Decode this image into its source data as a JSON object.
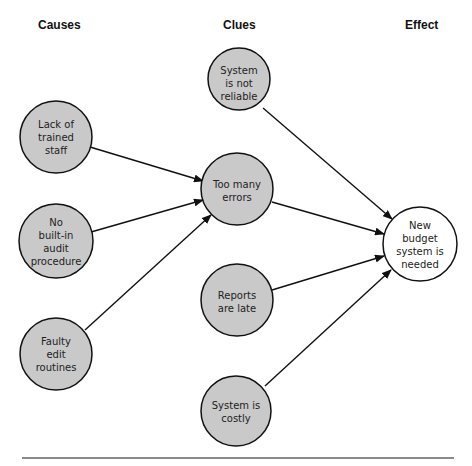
{
  "headers": {
    "causes": "Causes",
    "clues": "Clues",
    "effect": "Effect"
  },
  "colors": {
    "node_fill": "#c9c9c9",
    "effect_fill": "#ffffff",
    "stroke": "#111111"
  },
  "nodes": [
    {
      "id": "lack",
      "column": "causes",
      "lines": [
        "Lack of",
        "trained",
        "staff"
      ]
    },
    {
      "id": "audit",
      "column": "causes",
      "lines": [
        "No",
        "built-in",
        "audit",
        "procedure"
      ]
    },
    {
      "id": "faulty",
      "column": "causes",
      "lines": [
        "Faulty",
        "edit",
        "routines"
      ]
    },
    {
      "id": "reliable",
      "column": "clues",
      "lines": [
        "System",
        "is not",
        "reliable"
      ]
    },
    {
      "id": "errors",
      "column": "clues",
      "lines": [
        "Too many",
        "errors"
      ]
    },
    {
      "id": "reports",
      "column": "clues",
      "lines": [
        "Reports",
        "are late"
      ]
    },
    {
      "id": "costly",
      "column": "clues",
      "lines": [
        "System is",
        "costly"
      ]
    },
    {
      "id": "effect",
      "column": "effect",
      "lines": [
        "New",
        "budget",
        "system is",
        "needed"
      ]
    }
  ],
  "edges": [
    {
      "from": "lack",
      "to": "errors"
    },
    {
      "from": "audit",
      "to": "errors"
    },
    {
      "from": "faulty",
      "to": "errors"
    },
    {
      "from": "reliable",
      "to": "effect"
    },
    {
      "from": "errors",
      "to": "effect"
    },
    {
      "from": "reports",
      "to": "effect"
    },
    {
      "from": "costly",
      "to": "effect"
    }
  ]
}
